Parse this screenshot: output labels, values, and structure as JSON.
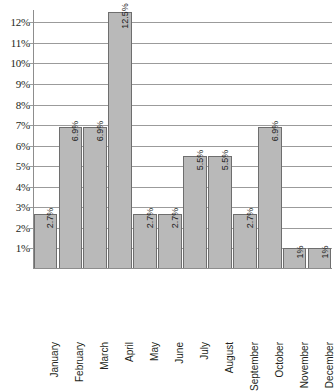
{
  "chart_data": {
    "type": "bar",
    "title": "",
    "subtitle": "",
    "xlabel": "",
    "ylabel": "",
    "categories": [
      "January",
      "February",
      "March",
      "April",
      "May",
      "June",
      "July",
      "August",
      "September",
      "October",
      "November",
      "December"
    ],
    "values": [
      2.7,
      6.9,
      6.9,
      12.5,
      2.7,
      2.7,
      5.5,
      5.5,
      2.7,
      6.9,
      1,
      1
    ],
    "data_labels": [
      "2.7%",
      "6.9%",
      "6.9%",
      "12.5%",
      "2.7%",
      "2.7%",
      "5.5%",
      "5.5%",
      "2.7%",
      "6.9%",
      "1%",
      "1%"
    ],
    "ylim": [
      0,
      12.6
    ],
    "ytick_values": [
      1,
      2,
      3,
      4,
      5,
      6,
      7,
      8,
      9,
      10,
      11,
      12
    ],
    "ytick_labels": [
      "1%",
      "2%",
      "3%",
      "4%",
      "5%",
      "6%",
      "7%",
      "8%",
      "9%",
      "10%",
      "11%",
      "12%"
    ],
    "grid": true,
    "grid_axis": "y",
    "legend": false,
    "legend_position": "none",
    "series": [
      {
        "name": "",
        "values": [
          2.7,
          6.9,
          6.9,
          12.5,
          2.7,
          2.7,
          5.5,
          5.5,
          2.7,
          6.9,
          1,
          1
        ]
      }
    ],
    "colors": {
      "bar_fill": "#b9b9b9",
      "bar_border": "#6e6e6e",
      "gridline": "#9b9b9b",
      "axis": "#8d8d8d",
      "text": "#231f20",
      "background": "#ffffff"
    }
  }
}
